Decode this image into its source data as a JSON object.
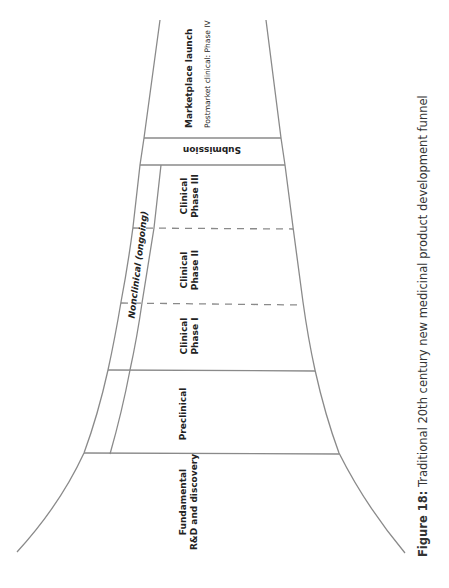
{
  "diagram": {
    "title": "Traditional 20th century new medicinal product development funnel",
    "stages": [
      {
        "id": "fundamental",
        "line1": "Fundamental",
        "line2": "R&D and discovery"
      },
      {
        "id": "preclinical",
        "line1": "Preclinical"
      },
      {
        "id": "phase1",
        "line1": "Clinical",
        "line2": "Phase I"
      },
      {
        "id": "phase2",
        "line1": "Clinical",
        "line2": "Phase II"
      },
      {
        "id": "phase3",
        "line1": "Clinical",
        "line2": "Phase III"
      },
      {
        "id": "submission",
        "line1": "Submission"
      },
      {
        "id": "marketplace",
        "line1": "Marketplace launch",
        "line2": "Postmarket clinical:  Phase IV"
      }
    ],
    "side_band": {
      "label": "Nonclinical (ongoing)"
    },
    "colors": {
      "line": "#888888",
      "text": "#222222"
    }
  },
  "caption": {
    "prefix": "Figure 18:",
    "text": " Traditional 20th century new medicinal product development funnel"
  }
}
